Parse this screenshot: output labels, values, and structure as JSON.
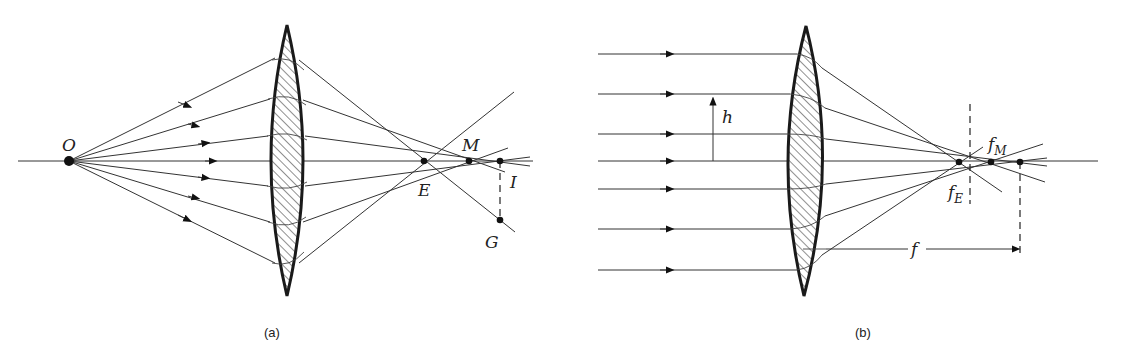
{
  "figure": {
    "panel_a": {
      "caption": "(a)",
      "labels": {
        "object": "O",
        "edge_focus": "E",
        "middle_focus": "M",
        "image": "I",
        "ray_point": "G"
      },
      "object_point": [
        69,
        161
      ],
      "lens": {
        "cx": 287,
        "top": 25,
        "bottom": 296,
        "half_width": 20
      },
      "points": {
        "E": [
          424,
          161
        ],
        "M": [
          469,
          161
        ],
        "I": [
          500,
          161
        ],
        "G": [
          500,
          220
        ]
      }
    },
    "panel_b": {
      "caption": "(b)",
      "labels": {
        "height": "h",
        "edge_focus": "f",
        "edge_focus_sub": "E",
        "middle_focus": "f",
        "middle_focus_sub": "M",
        "focal_length": "f"
      },
      "ray_heights": [
        54,
        94,
        134,
        161,
        189,
        229,
        270
      ],
      "lens": {
        "cx": 805,
        "top": 26,
        "bottom": 296,
        "half_width": 21
      },
      "points": {
        "fE": [
          959,
          162
        ],
        "fM": [
          991,
          162
        ],
        "f": [
          1020,
          162
        ]
      }
    },
    "colors": {
      "line": "#333333",
      "ink": "#111111",
      "background": "#ffffff"
    }
  }
}
